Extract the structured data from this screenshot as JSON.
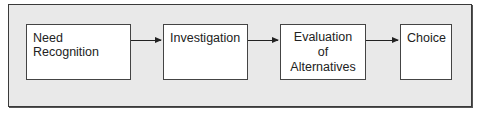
{
  "diagram": {
    "type": "flow",
    "steps": [
      {
        "label": "Need Recognition"
      },
      {
        "label": "Investigation"
      },
      {
        "label_lines": [
          "Evaluation",
          "of",
          "Alternatives"
        ]
      },
      {
        "label": "Choice"
      }
    ],
    "edges": [
      {
        "from": "Need Recognition",
        "to": "Investigation"
      },
      {
        "from": "Investigation",
        "to": "Evaluation of Alternatives"
      },
      {
        "from": "Evaluation of Alternatives",
        "to": "Choice"
      }
    ]
  }
}
